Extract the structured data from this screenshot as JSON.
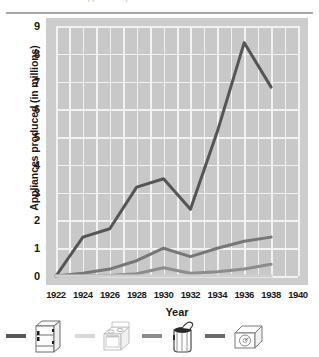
{
  "page": {
    "top_caption": "Appliances produced in the United States"
  },
  "chart_data": {
    "type": "line",
    "title": "",
    "subtitle": "",
    "xlabel": "Year",
    "ylabel": "Appliances produced (in millions)",
    "xlim": [
      1922,
      1940
    ],
    "ylim": [
      0,
      9
    ],
    "x_ticks": [
      "1922",
      "1924",
      "1926",
      "1928",
      "1930",
      "1932",
      "1934",
      "1936",
      "1938",
      "1940"
    ],
    "y_ticks": [
      "0",
      "1",
      "2",
      "3",
      "4",
      "5",
      "6",
      "7",
      "8",
      "9"
    ],
    "grid": "both",
    "legend_position": "below",
    "background": "#c8c8c8",
    "gridline_color": "#f2f2f2",
    "x": [
      1922,
      1924,
      1926,
      1928,
      1930,
      1932,
      1934,
      1936,
      1938
    ],
    "series": [
      {
        "name": "radio",
        "legend_label": "Radios",
        "icon": "radio-icon",
        "color": "#555555",
        "values": [
          0.0,
          1.4,
          1.7,
          3.2,
          3.5,
          2.4,
          5.2,
          8.4,
          6.8
        ]
      },
      {
        "name": "washing-machine",
        "legend_label": "Washing machines",
        "icon": "washing-machine-icon",
        "color": "#777777",
        "values": [
          0.0,
          0.1,
          0.25,
          0.55,
          1.0,
          0.7,
          1.0,
          1.25,
          1.4
        ]
      },
      {
        "name": "refrigerator",
        "legend_label": "Refrigerators",
        "icon": "refrigerator-icon",
        "color": "#8d8d8d",
        "values": [
          0.0,
          0.0,
          0.02,
          0.08,
          0.3,
          0.1,
          0.15,
          0.25,
          0.42
        ]
      },
      {
        "name": "stove",
        "legend_label": "Stoves",
        "icon": "stove-icon",
        "color": "#cfcfcf",
        "values": [
          0.0,
          0.0,
          0.0,
          0.0,
          0.0,
          0.0,
          0.0,
          0.0,
          0.0
        ]
      }
    ]
  },
  "legend": {
    "items": [
      {
        "icon": "refrigerator-icon",
        "label": "",
        "swatch_color": "#555555"
      },
      {
        "icon": "stove-icon",
        "label": "",
        "swatch_color": "#d8d8d8"
      },
      {
        "icon": "washing-machine-icon",
        "label": "",
        "swatch_color": "#8d8d8d"
      },
      {
        "icon": "radio-icon",
        "label": "",
        "swatch_color": "#6a6a6a"
      }
    ]
  }
}
